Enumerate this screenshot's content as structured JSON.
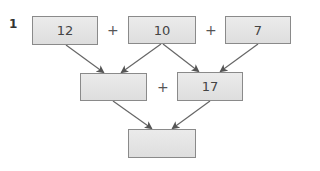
{
  "problem_number": "1",
  "colors": {
    "box_fill": "#e4e4e4",
    "box_border": "#8a8a8a",
    "arrow": "#555555"
  },
  "row1": [
    {
      "value": "12"
    },
    {
      "operator": "+"
    },
    {
      "value": "10"
    },
    {
      "operator": "+"
    },
    {
      "value": "7"
    }
  ],
  "row2": [
    {
      "value": ""
    },
    {
      "operator": "+"
    },
    {
      "value": "17"
    }
  ],
  "row3": [
    {
      "value": ""
    }
  ]
}
